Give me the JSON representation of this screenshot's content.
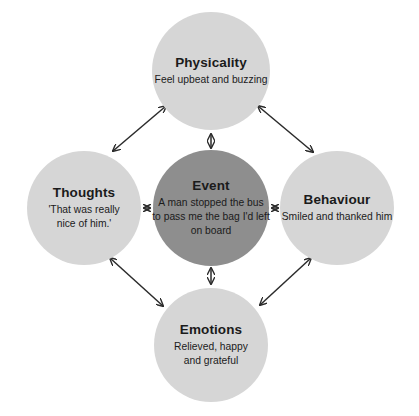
{
  "diagram": {
    "type": "cbt-five-areas-cycle",
    "canvas": {
      "width": 419,
      "height": 416,
      "background": "#ffffff"
    },
    "colors": {
      "outer_circle_fill": "#d6d6d6",
      "center_circle_fill": "#8e8e8e",
      "text": "#1b1b1b",
      "arrow": "#2b2b2b"
    },
    "nodes": [
      {
        "id": "physicality",
        "title": "Physicality",
        "lines": [
          "Feel upbeat and buzzing"
        ],
        "cx": 211,
        "cy": 71,
        "r": 59,
        "fill": "#d6d6d6",
        "role": "outer"
      },
      {
        "id": "thoughts",
        "title": "Thoughts",
        "lines": [
          "'That was really",
          "nice of him.'"
        ],
        "cx": 84,
        "cy": 208,
        "r": 57,
        "fill": "#d6d6d6",
        "role": "outer"
      },
      {
        "id": "event",
        "title": "Event",
        "lines": [
          "A man stopped the bus",
          "to pass me the bag I'd left",
          "on board"
        ],
        "cx": 211,
        "cy": 208,
        "r": 58,
        "fill": "#8e8e8e",
        "role": "center"
      },
      {
        "id": "behaviour",
        "title": "Behaviour",
        "lines": [
          "Smiled and thanked him"
        ],
        "cx": 337,
        "cy": 208,
        "r": 57,
        "fill": "#d6d6d6",
        "role": "outer"
      },
      {
        "id": "emotions",
        "title": "Emotions",
        "lines": [
          "Relieved, happy",
          "and grateful"
        ],
        "cx": 211,
        "cy": 345,
        "r": 57,
        "fill": "#d6d6d6",
        "role": "outer"
      }
    ],
    "connectors": [
      {
        "id": "physicality-event",
        "from": "physicality",
        "to": "event",
        "x1": 211,
        "y1": 134,
        "x2": 211,
        "y2": 148,
        "double": true
      },
      {
        "id": "thoughts-event",
        "from": "thoughts",
        "to": "event",
        "x1": 144,
        "y1": 208,
        "x2": 150,
        "y2": 208,
        "double": true
      },
      {
        "id": "event-behaviour",
        "from": "event",
        "to": "behaviour",
        "x1": 272,
        "y1": 208,
        "x2": 278,
        "y2": 208,
        "double": true
      },
      {
        "id": "event-emotions",
        "from": "event",
        "to": "emotions",
        "x1": 211,
        "y1": 268,
        "x2": 211,
        "y2": 284,
        "double": true
      },
      {
        "id": "thoughts-physicality",
        "from": "thoughts",
        "to": "physicality",
        "x1": 113,
        "y1": 151,
        "x2": 166,
        "y2": 106,
        "double": true
      },
      {
        "id": "physicality-behaviour",
        "from": "physicality",
        "to": "behaviour",
        "x1": 258,
        "y1": 106,
        "x2": 313,
        "y2": 152,
        "double": true
      },
      {
        "id": "thoughts-emotions",
        "from": "thoughts",
        "to": "emotions",
        "x1": 110,
        "y1": 258,
        "x2": 163,
        "y2": 306,
        "double": true
      },
      {
        "id": "behaviour-emotions",
        "from": "behaviour",
        "to": "emotions",
        "x1": 311,
        "y1": 258,
        "x2": 260,
        "y2": 305,
        "double": true
      }
    ]
  }
}
